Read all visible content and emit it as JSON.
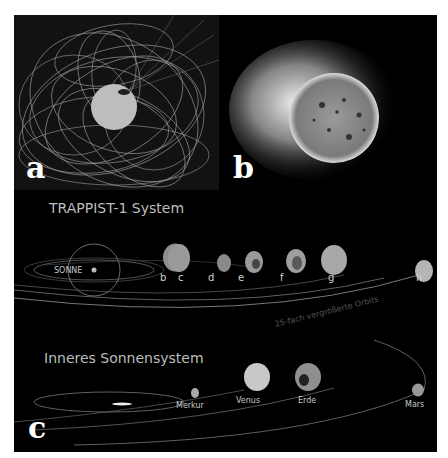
{
  "figure": {
    "panels": [
      {
        "id": "a",
        "label": "a",
        "description": "magnetic-field-lines-star"
      },
      {
        "id": "b",
        "label": "b",
        "description": "active-star-corona"
      },
      {
        "id": "c",
        "label": "c",
        "description": "planetary-system-comparison"
      }
    ],
    "trappist": {
      "title": "TRAPPIST-1 System",
      "sun_label": "SONNE",
      "planets": [
        "b",
        "c",
        "d",
        "e",
        "f",
        "g",
        "h"
      ]
    },
    "inner": {
      "title": "Inneres Sonnensystem",
      "orbit_note": "25-fach vergrößerte Orbits",
      "planets": [
        "Merkur",
        "Venus",
        "Erde",
        "Mars"
      ]
    },
    "colors": {
      "background": "#000000",
      "panel_a_bg": "#121212",
      "text": "#bdbdbd",
      "letters": "#ffffff"
    }
  }
}
